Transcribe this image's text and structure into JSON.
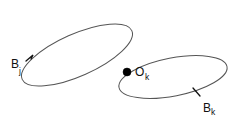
{
  "figure": {
    "background_color": "#ffffff",
    "stroke_color": "#555555",
    "label_color": "#111111",
    "dot_color": "#000000",
    "width": 232,
    "height": 119
  },
  "labels": {
    "left_region": {
      "base": "B",
      "subscript": "j",
      "full": "B_j"
    },
    "right_region": {
      "base": "B",
      "subscript": "k",
      "full": "B_k"
    },
    "node": {
      "base": "O",
      "subscript": "k",
      "full": "O_k"
    }
  },
  "shapes": {
    "left_ellipse": {
      "name": "B_j",
      "center_x": 77,
      "center_y": 55,
      "radius_x": 60,
      "radius_y": 21,
      "rotation_deg": -24
    },
    "right_ellipse": {
      "name": "B_k",
      "center_x": 173,
      "center_y": 77,
      "radius_x": 55,
      "radius_y": 19,
      "rotation_deg": -11
    },
    "node_dot": {
      "name": "O_k",
      "center_x": 127,
      "center_y": 72,
      "radius": 4
    }
  }
}
